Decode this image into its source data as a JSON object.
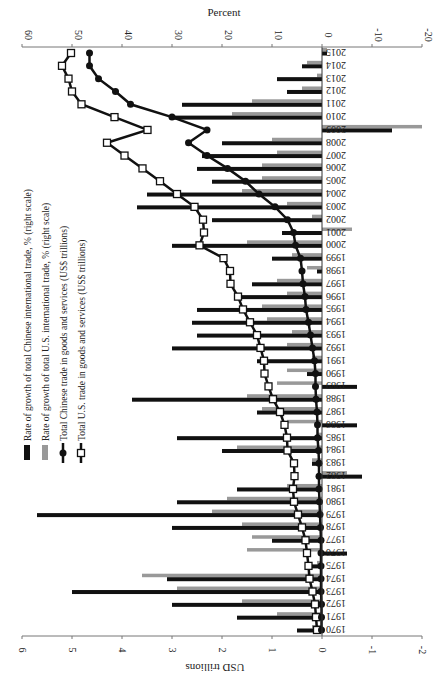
{
  "chart_data": {
    "type": "bar",
    "orientation": "rotated-90",
    "title": "",
    "top_axis_label": "Percent",
    "bottom_axis_label": "USD trillions",
    "percent_ticks": [
      60,
      50,
      40,
      30,
      20,
      10,
      0,
      -10,
      -20
    ],
    "usd_ticks": [
      6,
      5,
      4,
      3,
      2,
      1,
      0,
      -1,
      -2
    ],
    "percent_range": [
      -20,
      60
    ],
    "usd_range": [
      -2,
      6
    ],
    "categories": [
      1970,
      1971,
      1972,
      1973,
      1974,
      1975,
      1976,
      1977,
      1978,
      1979,
      1980,
      1981,
      1982,
      1983,
      1984,
      1985,
      1986,
      1987,
      1988,
      1989,
      1990,
      1991,
      1992,
      1993,
      1994,
      1995,
      1996,
      1997,
      1998,
      1999,
      2000,
      2001,
      2002,
      2003,
      2004,
      2005,
      2006,
      2007,
      2008,
      2009,
      2010,
      2011,
      2012,
      2013,
      2014,
      2015
    ],
    "series": [
      {
        "name": "Rate of growth of total Chinese international trade, % (right scale)",
        "kind": "bar",
        "scale": "percent",
        "color": "#111111",
        "values": [
          5,
          17,
          30,
          50,
          31,
          2,
          -5,
          10,
          30,
          57,
          29,
          17,
          -8,
          2,
          20,
          29,
          -7,
          13,
          38,
          -7,
          3,
          13,
          30,
          25,
          26,
          25,
          16,
          14,
          1,
          10,
          30,
          8,
          22,
          37,
          35,
          22,
          25,
          24,
          20,
          -14,
          30,
          28,
          7,
          9,
          4,
          -1
        ]
      },
      {
        "name": "Rate of growth of total U.S. international trade, % (right scale)",
        "kind": "bar",
        "scale": "percent",
        "color": "#999999",
        "values": [
          2,
          9,
          16,
          29,
          36,
          1,
          15,
          14,
          16,
          22,
          19,
          7,
          -5,
          2,
          17,
          1,
          7,
          12,
          15,
          9,
          7,
          2,
          7,
          6,
          11,
          12,
          7,
          9,
          3,
          6,
          15,
          -6,
          2,
          7,
          16,
          12,
          12,
          9,
          10,
          -20,
          18,
          14,
          4,
          1,
          3,
          -1
        ]
      },
      {
        "name": "Total Chinese trade in goods and services (US$ trillions)",
        "kind": "line",
        "marker": "circle-filled",
        "scale": "usd",
        "color": "#111111",
        "values": [
          0.01,
          0.01,
          0.01,
          0.02,
          0.02,
          0.02,
          0.02,
          0.02,
          0.03,
          0.04,
          0.05,
          0.06,
          0.06,
          0.06,
          0.07,
          0.09,
          0.09,
          0.1,
          0.12,
          0.13,
          0.13,
          0.15,
          0.19,
          0.23,
          0.27,
          0.32,
          0.34,
          0.38,
          0.4,
          0.43,
          0.53,
          0.57,
          0.69,
          0.94,
          1.26,
          1.53,
          1.89,
          2.3,
          2.67,
          2.3,
          3.0,
          3.83,
          4.13,
          4.47,
          4.65,
          4.65
        ]
      },
      {
        "name": "Total U.S. trade in goods and services (US$ trillions)",
        "kind": "line",
        "marker": "square-open",
        "scale": "usd",
        "color": "#111111",
        "values": [
          0.1,
          0.12,
          0.14,
          0.19,
          0.25,
          0.27,
          0.3,
          0.33,
          0.4,
          0.48,
          0.56,
          0.58,
          0.55,
          0.56,
          0.69,
          0.7,
          0.75,
          0.84,
          0.98,
          1.07,
          1.15,
          1.16,
          1.23,
          1.3,
          1.44,
          1.58,
          1.68,
          1.83,
          1.84,
          1.97,
          2.45,
          2.36,
          2.38,
          2.55,
          2.9,
          3.24,
          3.59,
          3.95,
          4.3,
          3.49,
          4.15,
          4.81,
          5.0,
          5.07,
          5.2,
          5.02
        ]
      }
    ],
    "legend": [
      "Rate of growth of total Chinese international trade, % (right scale)",
      "Rate of growth of total U.S. international trade, % (right scale)",
      "Total Chinese trade in goods and services (US$ trillions)",
      "Total U.S. trade in goods and services (US$ trillions)"
    ],
    "legend_position": "left (rotated)",
    "grid": false
  }
}
